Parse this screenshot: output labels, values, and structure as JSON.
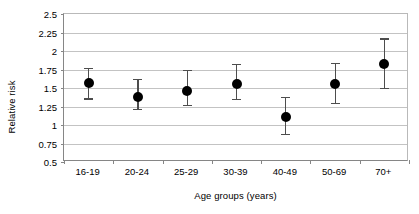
{
  "chart_data": {
    "type": "scatter",
    "title": "",
    "subtitle": "",
    "xlabel": "Age groups (years)",
    "ylabel": "Relative risk",
    "categories": [
      "16-19",
      "20-24",
      "25-29",
      "30-39",
      "40-49",
      "50-69",
      "70+"
    ],
    "values": [
      1.57,
      1.38,
      1.46,
      1.56,
      1.11,
      1.55,
      1.82
    ],
    "error_low": [
      1.36,
      1.22,
      1.27,
      1.35,
      0.88,
      1.3,
      1.5
    ],
    "error_high": [
      1.77,
      1.62,
      1.75,
      1.83,
      1.38,
      1.84,
      2.17
    ],
    "ylim": [
      0.5,
      2.5
    ],
    "ytick_step": 0.25,
    "ytick_labels": [
      "0.5",
      "0.75",
      "1",
      "1.25",
      "1.5",
      "1.75",
      "2",
      "2.25",
      "2.5"
    ],
    "ytick_values": [
      0.5,
      0.75,
      1,
      1.25,
      1.5,
      1.75,
      2,
      2.25,
      2.5
    ],
    "grid": true,
    "legend": "none",
    "marker_color": "#000000",
    "errorbar_color": "#4d4d4d",
    "gridline_color": "#c3c3c3",
    "axis_color": "#868686",
    "series": [
      {
        "name": "Relative risk",
        "points": [
          {
            "category": "16-19",
            "value": 1.57,
            "low": 1.36,
            "high": 1.77
          },
          {
            "category": "20-24",
            "value": 1.38,
            "low": 1.22,
            "high": 1.62
          },
          {
            "category": "25-29",
            "value": 1.46,
            "low": 1.27,
            "high": 1.75
          },
          {
            "category": "30-39",
            "value": 1.56,
            "low": 1.35,
            "high": 1.83
          },
          {
            "category": "40-49",
            "value": 1.11,
            "low": 0.88,
            "high": 1.38
          },
          {
            "category": "50-69",
            "value": 1.55,
            "low": 1.3,
            "high": 1.84
          },
          {
            "category": "70+",
            "value": 1.82,
            "low": 1.5,
            "high": 2.17
          }
        ]
      }
    ]
  }
}
